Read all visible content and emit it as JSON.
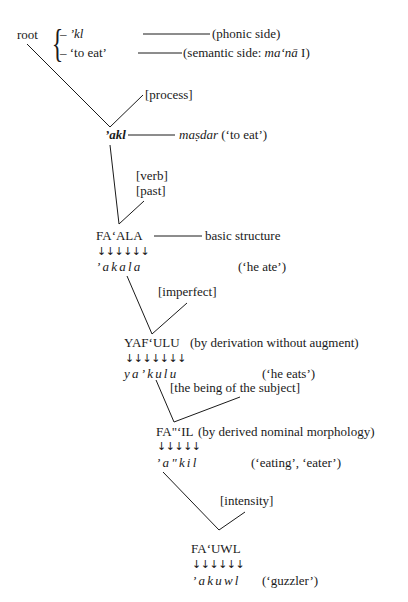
{
  "root": {
    "label": "root",
    "branches": [
      {
        "text_prefix": "– ",
        "text": "’kl",
        "italic": true,
        "gloss": "(phonic side)"
      },
      {
        "text_prefix": "– ",
        "text": "‘to eat’",
        "italic": false,
        "gloss_prefix": "(semantic side: ",
        "gloss_italic": "ma‘nā",
        "gloss_suffix": " I)"
      }
    ]
  },
  "features": {
    "process": "[process]",
    "verb": "[verb]",
    "past": "[past]",
    "imperfect": "[imperfect]",
    "being_of_subject": "[the being of the subject]",
    "intensity": "[intensity]"
  },
  "nodes": {
    "akl": {
      "form": "’akl",
      "link_italic": "maṣdar",
      "link_suffix": " (‘to eat’)"
    },
    "faala": {
      "pattern": "FA‘ALA",
      "note": "basic structure",
      "arrows": "↓↓↓↓↓↓",
      "realization": "’akala",
      "gloss": "(‘he ate’)"
    },
    "yafulu": {
      "pattern": "YAF‘ULU",
      "note": "(by derivation without augment)",
      "arrows": "↓↓↓↓↓↓↓",
      "realization": "ya’kulu",
      "gloss": "(‘he eats’)"
    },
    "faail": {
      "pattern": "FA\"‘IL",
      "note": "(by derived nominal morphology)",
      "arrows": "↓↓↓↓↓",
      "realization": "’a\"kil",
      "gloss": "(‘eating’, ‘eater’)"
    },
    "fauwl": {
      "pattern": "FA‘UWL",
      "arrows": "↓↓↓↓↓↓",
      "realization": "’akuwl",
      "gloss": "(‘guzzler’)"
    }
  }
}
